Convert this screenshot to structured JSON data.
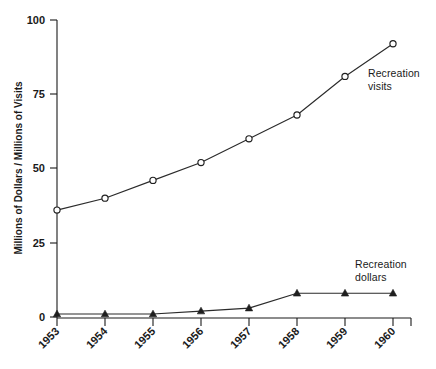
{
  "chart_data": {
    "type": "line",
    "title": "",
    "subtitle": "",
    "xlabel": "",
    "ylabel": "Millions of Dollars / Millions of Visits",
    "categories": [
      "1953",
      "1954",
      "1955",
      "1956",
      "1957",
      "1958",
      "1959",
      "1960"
    ],
    "x": [
      1953,
      1954,
      1955,
      1956,
      1957,
      1958,
      1959,
      1960
    ],
    "series": [
      {
        "name": "Recreation visits",
        "marker": "open-circle",
        "values": [
          36,
          40,
          46,
          52,
          60,
          68,
          81,
          92
        ],
        "annotation": "Recreation\nvisits",
        "annotation_line1": "Recreation",
        "annotation_line2": "visits"
      },
      {
        "name": "Recreation dollars",
        "marker": "filled-triangle",
        "values": [
          1,
          1,
          1,
          2,
          3,
          8,
          8,
          8
        ],
        "annotation": "Recreation\ndollars",
        "annotation_line1": "Recreation",
        "annotation_line2": "dollars"
      }
    ],
    "ylim": [
      0,
      100
    ],
    "yticks": [
      0,
      25,
      50,
      75,
      100
    ],
    "ytick_labels": [
      "0",
      "25",
      "50",
      "75",
      "100"
    ],
    "xtick_labels": [
      "1953",
      "1954",
      "1955",
      "1956",
      "1957",
      "1958",
      "1959",
      "1960"
    ],
    "xtick_rotation_deg": 45,
    "grid": false,
    "legend": "inline-annotations",
    "legend_position": "right-of-curve-ends",
    "colors": {
      "axis": "#1a1a1a",
      "visits_line": "#2b2b2b",
      "dollars_line": "#2b2b2b",
      "background": "#ffffff"
    }
  },
  "axis": {
    "y_title": "Millions of Dollars / Millions of Visits",
    "ytick_0": "0",
    "ytick_25": "25",
    "ytick_50": "50",
    "ytick_75": "75",
    "ytick_100": "100",
    "xtick_0": "1953",
    "xtick_1": "1954",
    "xtick_2": "1955",
    "xtick_3": "1956",
    "xtick_4": "1957",
    "xtick_5": "1958",
    "xtick_6": "1959",
    "xtick_7": "1960"
  },
  "footer": {
    "scan_artifact_text": ""
  }
}
